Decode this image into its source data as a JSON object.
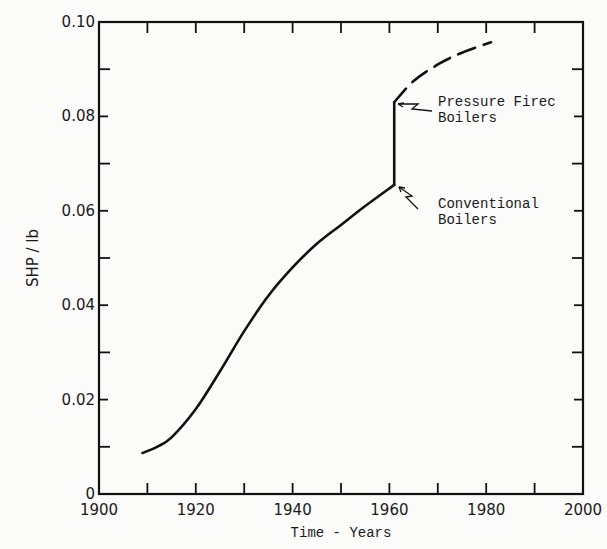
{
  "chart_data": {
    "type": "line",
    "title": "",
    "xlabel": "Time - Years",
    "ylabel": "SHP / lb",
    "xlim": [
      1900,
      2000
    ],
    "ylim": [
      0,
      0.1
    ],
    "x_ticks": [
      "1900",
      "1920",
      "1940",
      "1960",
      "1980",
      "2000"
    ],
    "y_ticks": [
      "0",
      "0.02",
      "0.04",
      "0.06",
      "0.08",
      "0.10"
    ],
    "grid": false,
    "series": [
      {
        "name": "Conventional Boilers",
        "style": "solid",
        "x": [
          1909,
          1912,
          1915,
          1920,
          1925,
          1930,
          1935,
          1940,
          1945,
          1950,
          1955,
          1961
        ],
        "y": [
          0.0087,
          0.01,
          0.012,
          0.018,
          0.026,
          0.0345,
          0.042,
          0.048,
          0.053,
          0.057,
          0.061,
          0.0655
        ]
      },
      {
        "name": "Jump (conversion)",
        "style": "solid",
        "x": [
          1961,
          1961
        ],
        "y": [
          0.0655,
          0.083
        ]
      },
      {
        "name": "Pressure Fired Boilers",
        "style": "dashed",
        "x": [
          1961,
          1965,
          1970,
          1975,
          1981
        ],
        "y": [
          0.083,
          0.0875,
          0.091,
          0.0935,
          0.0957
        ]
      }
    ],
    "annotations": [
      {
        "text_line1": "Pressure Firec",
        "text_line2": "Boilers",
        "points_to": [
          1961,
          0.083
        ]
      },
      {
        "text_line1": "Conventional",
        "text_line2": "Boilers",
        "points_to": [
          1961,
          0.0655
        ]
      }
    ]
  }
}
